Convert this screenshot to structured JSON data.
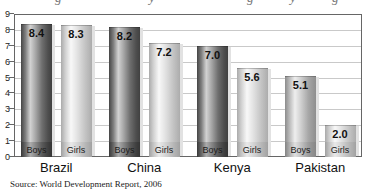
{
  "chart_data": {
    "type": "bar",
    "categories": [
      "Brazil",
      "China",
      "Kenya",
      "Pakistan"
    ],
    "series": [
      {
        "name": "Boys",
        "values": [
          8.4,
          8.2,
          7.0,
          5.1
        ],
        "shades": [
          "dark",
          "dark",
          "dark",
          "medium"
        ]
      },
      {
        "name": "Girls",
        "values": [
          8.3,
          7.2,
          5.6,
          2.0
        ],
        "shades": [
          "light",
          "light",
          "light",
          "light"
        ]
      }
    ],
    "ylim": [
      0,
      9
    ],
    "yticks": [
      0,
      1,
      2,
      3,
      4,
      5,
      6,
      7,
      8,
      9
    ],
    "grid": true,
    "legend_position": "none",
    "bar_labels_inside": true,
    "value_labels_shown": true,
    "source": "Source: World Development Report, 2006",
    "title_visible": false,
    "clipped_title_fragments": [
      {
        "char": "g",
        "x": 55
      },
      {
        "char": "y",
        "x": 149
      },
      {
        "char": "g",
        "x": 247
      },
      {
        "char": "y",
        "x": 290
      },
      {
        "char": "g",
        "x": 332
      }
    ],
    "colors": {
      "boys_bar": "#4a4a4a",
      "boys_bar_pakistan": "#9a9a9a",
      "girls_bar": "#d9d9d9",
      "gridline": "#c9c9c9",
      "plot_border": "#666666",
      "text": "#1a1a1a"
    }
  }
}
